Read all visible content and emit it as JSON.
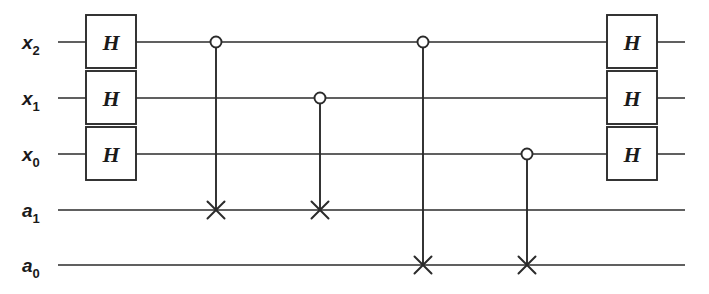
{
  "figure": {
    "background_color": "#ffffff",
    "ink_color": "#2b2b2b",
    "width": 709,
    "height": 294
  },
  "wires": [
    {
      "id": "x2",
      "label_base": "x",
      "label_sub": "2",
      "y": 42,
      "x_start": 58,
      "x_end": 685
    },
    {
      "id": "x1",
      "label_base": "x",
      "label_sub": "1",
      "y": 98,
      "x_start": 58,
      "x_end": 685
    },
    {
      "id": "x0",
      "label_base": "x",
      "label_sub": "0",
      "y": 154,
      "x_start": 58,
      "x_end": 685
    },
    {
      "id": "a1",
      "label_base": "a",
      "label_sub": "1",
      "y": 210,
      "x_start": 58,
      "x_end": 685
    },
    {
      "id": "a0",
      "label_base": "a",
      "label_sub": "0",
      "y": 265,
      "x_start": 58,
      "x_end": 685
    }
  ],
  "label_positions": {
    "x": 22,
    "sub_dx": 13,
    "sub_dy": 6
  },
  "gates": [
    {
      "name": "hadamard-x2-left",
      "type": "box",
      "label": "H",
      "wire": "x2",
      "x": 86,
      "y": 15,
      "w": 50,
      "h": 53
    },
    {
      "name": "hadamard-x1-left",
      "type": "box",
      "label": "H",
      "wire": "x1",
      "x": 86,
      "y": 71,
      "w": 50,
      "h": 53
    },
    {
      "name": "hadamard-x0-left",
      "type": "box",
      "label": "H",
      "wire": "x0",
      "x": 86,
      "y": 127,
      "w": 50,
      "h": 53
    },
    {
      "name": "hadamard-x2-right",
      "type": "box",
      "label": "H",
      "wire": "x2",
      "x": 607,
      "y": 15,
      "w": 50,
      "h": 53
    },
    {
      "name": "hadamard-x1-right",
      "type": "box",
      "label": "H",
      "wire": "x1",
      "x": 607,
      "y": 71,
      "w": 50,
      "h": 53
    },
    {
      "name": "hadamard-x0-right",
      "type": "box",
      "label": "H",
      "wire": "x0",
      "x": 607,
      "y": 127,
      "w": 50,
      "h": 53
    }
  ],
  "cnots": [
    {
      "name": "cnot-x2-a1",
      "x": 216,
      "control_wire": "x2",
      "control_y": 42,
      "target_wire": "a1",
      "target_y": 210
    },
    {
      "name": "cnot-x1-a1",
      "x": 320,
      "control_wire": "x1",
      "control_y": 98,
      "target_wire": "a1",
      "target_y": 210
    },
    {
      "name": "cnot-x2-a0",
      "x": 423,
      "control_wire": "x2",
      "control_y": 42,
      "target_wire": "a0",
      "target_y": 265
    },
    {
      "name": "cnot-x0-a0",
      "x": 527,
      "control_wire": "x0",
      "control_y": 154,
      "target_wire": "a0",
      "target_y": 265
    }
  ],
  "glyphs": {
    "control_radius": 5.5,
    "target_arm": 8.5,
    "gate_letter": "H"
  }
}
